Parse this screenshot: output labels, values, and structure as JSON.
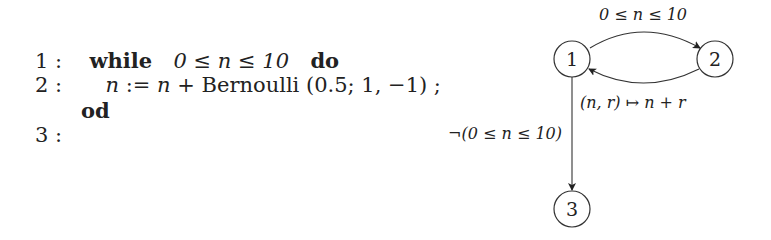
{
  "program": {
    "lines": [
      {
        "num": "1 :",
        "keyword": "while",
        "cond": "0 ≤ n ≤ 10",
        "end_kw": "do"
      },
      {
        "num": "2 :",
        "stmt_lhs": "n",
        "stmt_op": ":= ",
        "stmt_rhs_var": "n",
        "stmt_rest": " + Bernoulli (0.5; 1, −1) ;"
      },
      {
        "keyword": "od"
      },
      {
        "num": "3 :"
      }
    ]
  },
  "graph": {
    "nodes": [
      {
        "id": "1",
        "label": "1"
      },
      {
        "id": "2",
        "label": "2"
      },
      {
        "id": "3",
        "label": "3"
      }
    ],
    "edges": [
      {
        "from": "1",
        "to": "2",
        "label": "0 ≤ n ≤ 10"
      },
      {
        "from": "2",
        "to": "1",
        "label": "(n, r) ↦ n + r"
      },
      {
        "from": "1",
        "to": "3",
        "label": "¬(0 ≤ n ≤ 10)"
      }
    ]
  }
}
